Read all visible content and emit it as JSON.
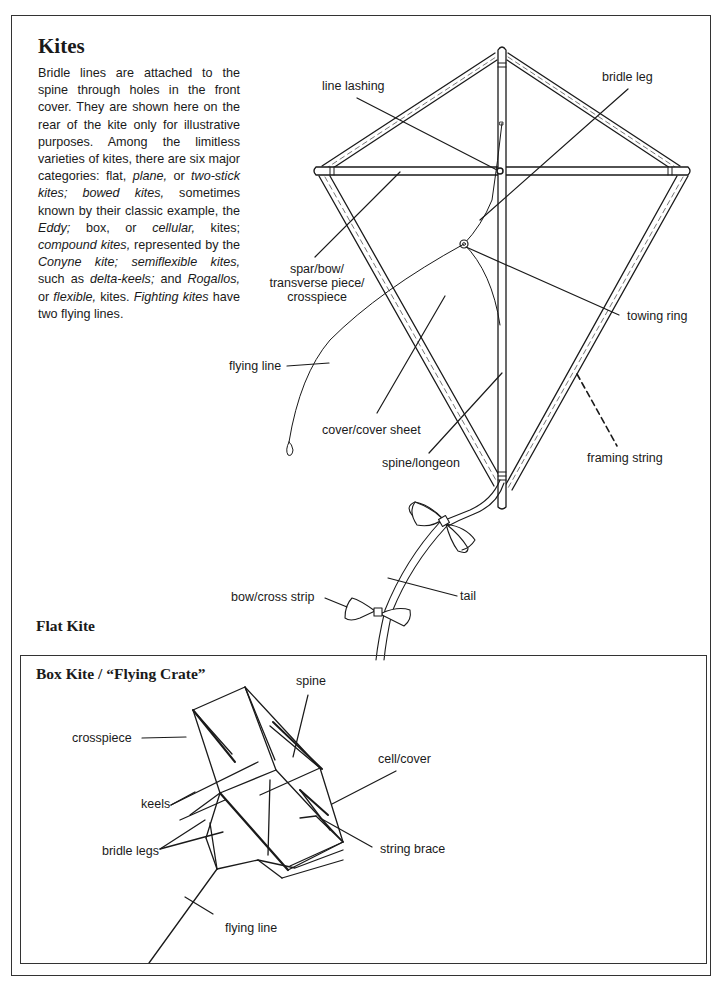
{
  "page": {
    "title": "Kites",
    "intro_segments": [
      {
        "text": "Bridle lines are attached to the spine through holes in the front cover. They are shown here on the rear of the kite only for illustrative purposes. Among the limitless varieties of kites, there are six major categories: flat, ",
        "italic": false
      },
      {
        "text": "plane,",
        "italic": true
      },
      {
        "text": " or ",
        "italic": false
      },
      {
        "text": "two-stick kites; bowed kites,",
        "italic": true
      },
      {
        "text": " sometimes known by their classic example, the ",
        "italic": false
      },
      {
        "text": "Eddy;",
        "italic": true
      },
      {
        "text": " box, or ",
        "italic": false
      },
      {
        "text": "cellular,",
        "italic": true
      },
      {
        "text": " kites; ",
        "italic": false
      },
      {
        "text": "compound kites,",
        "italic": true
      },
      {
        "text": " represented by the ",
        "italic": false
      },
      {
        "text": "Conyne kite; semiflexible kites,",
        "italic": true
      },
      {
        "text": " such as ",
        "italic": false
      },
      {
        "text": "delta-keels;",
        "italic": true
      },
      {
        "text": " and ",
        "italic": false
      },
      {
        "text": "Rogallos,",
        "italic": true
      },
      {
        "text": " or ",
        "italic": false
      },
      {
        "text": "flexible,",
        "italic": true
      },
      {
        "text": " kites. ",
        "italic": false
      },
      {
        "text": "Fighting kites",
        "italic": true
      },
      {
        "text": " have two flying lines.",
        "italic": false
      }
    ]
  },
  "flat_kite": {
    "title": "Flat Kite",
    "labels": {
      "line_lashing": "line lashing",
      "bridle_leg": "bridle leg",
      "spar_line1": "spar/bow/",
      "spar_line2": "transverse piece/",
      "spar_line3": "crosspiece",
      "towing_ring": "towing ring",
      "flying_line": "flying line",
      "cover": "cover/cover sheet",
      "spine": "spine/longeon",
      "framing_string": "framing string",
      "tail": "tail",
      "bow": "bow/cross strip"
    }
  },
  "box_kite": {
    "title": "Box Kite / “Flying Crate”",
    "labels": {
      "spine": "spine",
      "crosspiece": "crosspiece",
      "cell_cover": "cell/cover",
      "keels": "keels",
      "bridle_legs": "bridle legs",
      "string_brace": "string brace",
      "flying_line": "flying line"
    }
  },
  "colors": {
    "ink": "#1a1a1a",
    "frame": "#333333",
    "background": "#ffffff"
  }
}
